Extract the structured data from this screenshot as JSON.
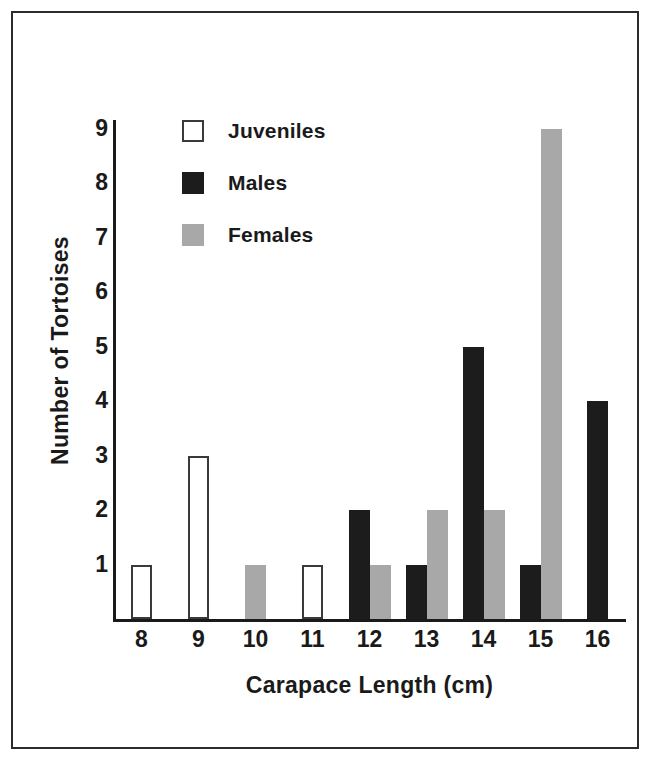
{
  "chart_data": {
    "type": "bar",
    "title": "",
    "subtitle": "",
    "xlabel": "Carapace Length (cm)",
    "ylabel": "Number of Tortoises",
    "categories": [
      "8",
      "9",
      "10",
      "11",
      "12",
      "13",
      "14",
      "15",
      "16"
    ],
    "xlim": [
      7.5,
      16.5
    ],
    "ylim": [
      0,
      9.5
    ],
    "yticks": [
      "9",
      "8",
      "7",
      "6",
      "5",
      "4",
      "3",
      "2",
      "1"
    ],
    "ytick_values": [
      9,
      8,
      7,
      6,
      5,
      4,
      3,
      2,
      1
    ],
    "grid": false,
    "legend_position": "upper-left-inside",
    "series": [
      {
        "name": "Juveniles",
        "color": "#ffffff",
        "edge_color": "#3a3a3a",
        "values": [
          1,
          3,
          0,
          1,
          0,
          0,
          0,
          0,
          0
        ]
      },
      {
        "name": "Males",
        "color": "#1c1c1c",
        "edge_color": "#1c1c1c",
        "values": [
          0,
          0,
          0,
          0,
          2,
          1,
          5,
          1,
          4
        ]
      },
      {
        "name": "Females",
        "color": "#a8a8a8",
        "edge_color": "#a8a8a8",
        "values": [
          0,
          0,
          1,
          0,
          1,
          2,
          2,
          9,
          0
        ]
      }
    ],
    "bars": [
      {
        "category": "8",
        "series": "Juveniles",
        "value": 1,
        "slot": 0
      },
      {
        "category": "9",
        "series": "Juveniles",
        "value": 3,
        "slot": 0
      },
      {
        "category": "10",
        "series": "Females",
        "value": 1,
        "slot": 1
      },
      {
        "category": "11",
        "series": "Juveniles",
        "value": 1,
        "slot": 0
      },
      {
        "category": "12",
        "series": "Males",
        "value": 2,
        "slot": 0
      },
      {
        "category": "12",
        "series": "Females",
        "value": 1,
        "slot": 1
      },
      {
        "category": "13",
        "series": "Males",
        "value": 1,
        "slot": 0
      },
      {
        "category": "13",
        "series": "Females",
        "value": 2,
        "slot": 1
      },
      {
        "category": "14",
        "series": "Males",
        "value": 5,
        "slot": 0
      },
      {
        "category": "14",
        "series": "Females",
        "value": 2,
        "slot": 1
      },
      {
        "category": "15",
        "series": "Males",
        "value": 1,
        "slot": 0
      },
      {
        "category": "15",
        "series": "Females",
        "value": 9,
        "slot": 1
      },
      {
        "category": "16",
        "series": "Males",
        "value": 4,
        "slot": 0
      }
    ]
  },
  "legend": {
    "items": [
      {
        "label": "Juveniles",
        "swatch": "juveniles"
      },
      {
        "label": "Males",
        "swatch": "males"
      },
      {
        "label": "Females",
        "swatch": "females"
      }
    ]
  },
  "colors": {
    "axis": "#1a1a1a",
    "frame": "#2b2b2b",
    "background": "#ffffff",
    "juveniles": "#ffffff",
    "males": "#1c1c1c",
    "females": "#a8a8a8"
  }
}
